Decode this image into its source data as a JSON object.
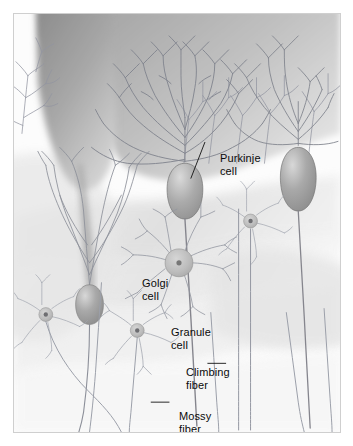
{
  "figure": {
    "frame": {
      "border_color": "#cfcfcf",
      "background_color": "#fbfbfb",
      "width": 328,
      "height": 420
    },
    "palette": {
      "page_background": "#ffffff",
      "dark_wedge": "#8c8c8c",
      "mid_gray_band": "#d2d2d2",
      "light_gray_band": "#e8e8e8",
      "pale_band": "#f4f4f4",
      "soma_fill": "#9a9a9a",
      "soma_highlight": "#cfcfcf",
      "dendrite_stroke": "#8e8e96",
      "fiber_stroke": "#a0a0a8",
      "granule_body": "#b4b4b8",
      "granule_nucleus": "#6e6e72",
      "label_text": "#0a0a0a",
      "leader_line": "#111111"
    }
  },
  "labels": [
    {
      "id": "purkinje",
      "text": "Purkinje\ncell",
      "leader": "diagonal-down-left"
    },
    {
      "id": "golgi",
      "text": "Golgi\ncell",
      "leader": "none"
    },
    {
      "id": "granule",
      "text": "Granule\ncell",
      "leader": "none"
    },
    {
      "id": "climbing",
      "text": "Climbing\nfiber",
      "leader": "dash-right"
    },
    {
      "id": "mossy",
      "text": "Mossy\nfiber",
      "leader": "dash-left"
    }
  ],
  "structures": {
    "purkinje_cells": 3,
    "golgi_cells": 1,
    "granule_cells": 3,
    "climbing_fibers": 2,
    "mossy_fibers": 5
  }
}
